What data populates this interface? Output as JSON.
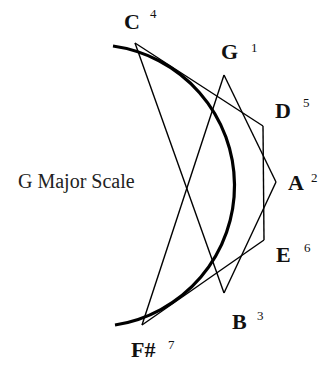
{
  "title": "G Major Scale",
  "notes": [
    {
      "name": "C",
      "degree": "4",
      "x": 135,
      "y": 43,
      "lx": 124,
      "ly": 29,
      "dx": 150,
      "dy": 18
    },
    {
      "name": "G",
      "degree": "1",
      "x": 224,
      "y": 75,
      "lx": 221,
      "ly": 59,
      "dx": 251,
      "dy": 52
    },
    {
      "name": "D",
      "degree": "5",
      "x": 263,
      "y": 126,
      "lx": 275,
      "ly": 118,
      "dx": 303,
      "dy": 107
    },
    {
      "name": "A",
      "degree": "2",
      "x": 276,
      "y": 182,
      "lx": 288,
      "ly": 190,
      "dx": 311,
      "dy": 182
    },
    {
      "name": "E",
      "degree": "6",
      "x": 264,
      "y": 240,
      "lx": 276,
      "ly": 262,
      "dx": 304,
      "dy": 252
    },
    {
      "name": "B",
      "degree": "3",
      "x": 224,
      "y": 293,
      "lx": 232,
      "ly": 329,
      "dx": 257,
      "dy": 320
    },
    {
      "name": "F#",
      "degree": "7",
      "x": 142,
      "y": 325,
      "lx": 131,
      "ly": 357,
      "dx": 168,
      "dy": 349
    }
  ],
  "edges": [
    [
      "C",
      "D"
    ],
    [
      "D",
      "E"
    ],
    [
      "E",
      "F#"
    ],
    [
      "F#",
      "G"
    ],
    [
      "G",
      "A"
    ],
    [
      "A",
      "B"
    ],
    [
      "B",
      "C"
    ]
  ],
  "arc": {
    "cx": 135,
    "cy": 184,
    "r": 141,
    "start": [
      113,
      46
    ],
    "end": [
      115,
      325
    ],
    "color": "#000000"
  }
}
